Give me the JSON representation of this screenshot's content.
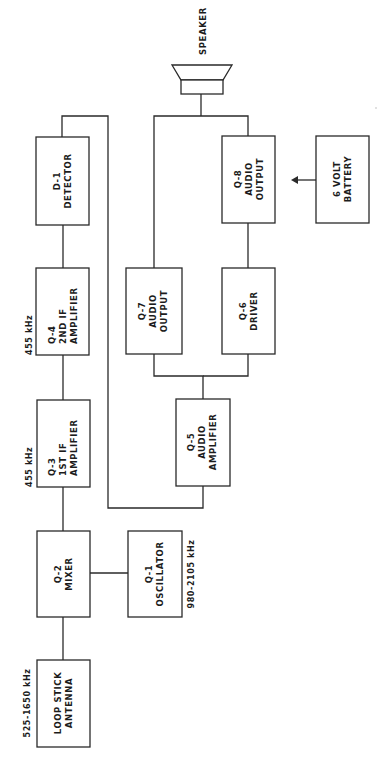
{
  "diagram": {
    "orientation": "rotated 90deg counter-clockwise",
    "blocks": {
      "antenna": {
        "id": "",
        "line1": "LOOP STICK",
        "line2": "ANTENNA",
        "freq": "525-1650 kHz"
      },
      "mixer": {
        "id": "Q-2",
        "line1": "MIXER"
      },
      "oscillator": {
        "id": "Q-1",
        "line1": "OSCILLATOR",
        "freq": "980-2105 kHz"
      },
      "if1": {
        "id": "Q-3",
        "line1": "1ST IF",
        "line2": "AMPLIFIER",
        "freq": "455 kHz"
      },
      "if2": {
        "id": "Q-4",
        "line1": "2ND IF",
        "line2": "AMPLIFIER",
        "freq": "455 kHz"
      },
      "detector": {
        "id": "D-1",
        "line1": "DETECTOR"
      },
      "audio_amp": {
        "id": "Q-5",
        "line1": "AUDIO",
        "line2": "AMPLIFIER"
      },
      "audio_out7": {
        "id": "Q-7",
        "line1": "AUDIO",
        "line2": "OUTPUT"
      },
      "driver": {
        "id": "Q-6",
        "line1": "DRIVER"
      },
      "audio_out8": {
        "id": "Q-8",
        "line1": "AUDIO",
        "line2": "OUTPUT"
      },
      "battery": {
        "line1": "6 VOLT",
        "line2": "BATTERY"
      },
      "speaker": {
        "label": "SPEAKER"
      }
    },
    "connections": [
      "LOOP STICK ANTENNA -> Q-2 MIXER",
      "Q-1 OSCILLATOR -> Q-2 MIXER",
      "Q-2 MIXER -> Q-3 1ST IF AMPLIFIER",
      "Q-3 1ST IF AMPLIFIER -> Q-4 2ND IF AMPLIFIER",
      "Q-4 2ND IF AMPLIFIER -> D-1 DETECTOR",
      "D-1 DETECTOR -> Q-5 AUDIO AMPLIFIER",
      "Q-5 AUDIO AMPLIFIER -> Q-7 AUDIO OUTPUT",
      "Q-5 AUDIO AMPLIFIER -> Q-6 DRIVER",
      "Q-6 DRIVER -> Q-8 AUDIO OUTPUT",
      "Q-7 AUDIO OUTPUT -> SPEAKER",
      "Q-8 AUDIO OUTPUT -> SPEAKER",
      "6 VOLT BATTERY -> Q-8 AUDIO OUTPUT"
    ]
  }
}
